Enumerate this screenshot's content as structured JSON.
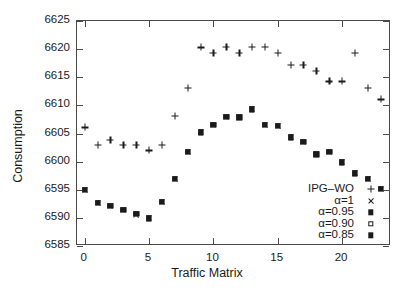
{
  "chart_data": {
    "type": "scatter",
    "title": "",
    "xlabel": "Traffic Matrix",
    "ylabel": "Consumption",
    "xlim": [
      -0.6,
      23.8
    ],
    "ylim": [
      6585,
      6625
    ],
    "xticks": [
      0,
      5,
      10,
      15,
      20
    ],
    "yticks": [
      6585,
      6590,
      6595,
      6600,
      6605,
      6610,
      6615,
      6620,
      6625
    ],
    "xtick_labels": [
      "0",
      "5",
      "10",
      "15",
      "20"
    ],
    "ytick_labels": [
      "6585",
      "6590",
      "6595",
      "6600",
      "6605",
      "6610",
      "6615",
      "6620",
      "6625"
    ],
    "grid": false,
    "legend_position": "lower-right",
    "marker_color": "#1a1a1a",
    "x": [
      0,
      1,
      2,
      3,
      4,
      5,
      6,
      7,
      8,
      9,
      10,
      11,
      12,
      13,
      14,
      15,
      16,
      17,
      18,
      19,
      20,
      21,
      22,
      23
    ],
    "series": [
      {
        "name": "IPG-WO",
        "marker": "plus",
        "values": [
          6606.1,
          6603.0,
          6603.9,
          6603.0,
          6603.0,
          6602.0,
          6603.0,
          6608.1,
          6613.1,
          6620.3,
          6619.3,
          6620.4,
          6619.4,
          6620.4,
          6620.4,
          6619.3,
          6617.2,
          6617.2,
          6616.2,
          6614.3,
          6614.3,
          6619.3,
          6613.1,
          6611.1
        ]
      },
      {
        "name": "alpha=1",
        "marker": "cross",
        "values": [
          6595.0,
          6592.6,
          6592.2,
          6591.4,
          6590.6,
          6589.9,
          6592.9,
          6597.0,
          6601.7,
          6605.2,
          6606.6,
          6608.0,
          6607.9,
          6609.3,
          6606.6,
          6606.4,
          6604.3,
          6603.5,
          6601.3,
          6601.7,
          6599.9,
          6597.9,
          6597.0,
          6595.2
        ]
      },
      {
        "name": "alpha=0.95",
        "marker": "filled-square",
        "values": [
          6595.0,
          6592.7,
          6592.2,
          6591.4,
          6590.7,
          6589.9,
          6592.9,
          6597.0,
          6601.7,
          6605.2,
          6606.6,
          6608.0,
          6607.9,
          6609.3,
          6606.6,
          6606.4,
          6604.3,
          6603.5,
          6601.3,
          6601.7,
          6599.9,
          6597.9,
          6597.0,
          6595.2
        ]
      },
      {
        "name": "alpha=0.90",
        "marker": "open-square",
        "values": [
          6595.0,
          6592.7,
          6592.2,
          6591.4,
          6590.7,
          6589.9,
          6592.9,
          6597.0,
          6601.7,
          6605.2,
          6606.6,
          6608.0,
          6607.9,
          6609.3,
          6606.6,
          6606.4,
          6604.3,
          6603.5,
          6601.3,
          6601.7,
          6599.9,
          6597.9,
          6597.0,
          6595.2
        ]
      },
      {
        "name": "alpha=0.85",
        "marker": "filled-square",
        "values": [
          6595.0,
          6592.7,
          6592.2,
          6591.4,
          6590.7,
          6589.9,
          6592.9,
          6597.0,
          6601.7,
          6605.2,
          6606.6,
          6608.0,
          6607.9,
          6609.3,
          6606.6,
          6606.4,
          6604.3,
          6603.5,
          6601.3,
          6601.7,
          6599.9,
          6597.9,
          6597.0,
          6595.2
        ]
      }
    ],
    "legend": [
      {
        "label": "IPG–WO",
        "marker": "plus"
      },
      {
        "label": "α=1",
        "marker": "cross"
      },
      {
        "label": "α=0.95",
        "marker": "filled-square"
      },
      {
        "label": "α=0.90",
        "marker": "open-square"
      },
      {
        "label": "α=0.85",
        "marker": "filled-square"
      }
    ]
  }
}
